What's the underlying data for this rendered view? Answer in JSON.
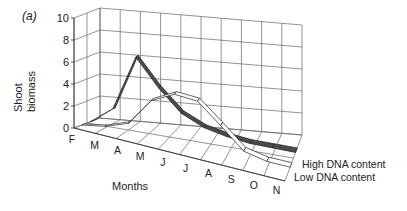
{
  "panel_label": "(a)",
  "chart_data": {
    "type": "area",
    "subtype": "3d-ribbon-line",
    "title": "",
    "xlabel": "Months",
    "ylabel": "Shoot biomass",
    "ylim": [
      0,
      10
    ],
    "yticks": [
      "0",
      "2",
      "4",
      "6",
      "8",
      "10"
    ],
    "categories": [
      "F",
      "M",
      "A",
      "M",
      "J",
      "J",
      "A",
      "S",
      "O",
      "N"
    ],
    "grid": true,
    "legend_position": "right-inline",
    "series": [
      {
        "name": "High DNA content",
        "color": "#555555",
        "values": [
          0,
          1.5,
          6.5,
          4.0,
          2.0,
          1.0,
          0.5,
          0.2,
          0.1,
          0
        ]
      },
      {
        "name": "Low DNA content",
        "color": "#ffffff",
        "values": [
          0,
          0.3,
          1.0,
          3.5,
          4.5,
          4.3,
          2.5,
          0.6,
          0.1,
          0
        ]
      }
    ]
  }
}
